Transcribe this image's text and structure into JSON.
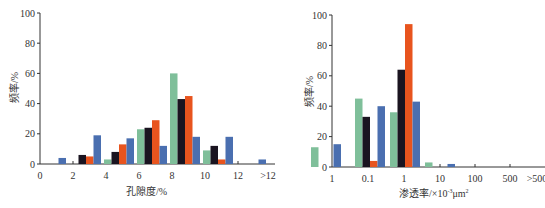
{
  "colors": {
    "green": "#7fbf9a",
    "black": "#1a1420",
    "orange": "#e8541e",
    "blue": "#4a6fb0"
  },
  "chart_data": [
    {
      "type": "bar",
      "title": "",
      "xlabel": "孔隙度/%",
      "ylabel": "频率/%",
      "ylim": [
        0,
        100
      ],
      "yticks": [
        0,
        20,
        40,
        60,
        80,
        100
      ],
      "xtick_labels": [
        "0",
        "2",
        "4",
        "6",
        "8",
        "10",
        "12",
        ">12"
      ],
      "categories": [
        "0-2",
        "2-4",
        "4-6",
        "6-8",
        "8-10",
        "10-12",
        ">12"
      ],
      "series": [
        {
          "name": "green",
          "color": "#7fbf9a",
          "values": [
            0,
            0,
            3,
            23,
            60,
            9,
            0
          ]
        },
        {
          "name": "black",
          "color": "#1a1420",
          "values": [
            0,
            6,
            8,
            24,
            43,
            12,
            0
          ]
        },
        {
          "name": "orange",
          "color": "#e8541e",
          "values": [
            0,
            5,
            13,
            29,
            45,
            3,
            0
          ]
        },
        {
          "name": "blue",
          "color": "#4a6fb0",
          "values": [
            4,
            19,
            17,
            12,
            18,
            18,
            3
          ]
        }
      ],
      "grid": false,
      "legend": "none"
    },
    {
      "type": "bar",
      "title": "",
      "xlabel": "渗透率/×10⁻³μm²",
      "ylabel": "频率/%",
      "ylim": [
        0,
        100
      ],
      "yticks": [
        0,
        20,
        40,
        60,
        80,
        100
      ],
      "xtick_labels": [
        "1",
        "0.1",
        "1",
        "10",
        "100",
        "500",
        ">500"
      ],
      "categories": [
        "<0.1",
        "0.1-1",
        "1-10",
        "10-100",
        "100-500",
        ">500"
      ],
      "series": [
        {
          "name": "green",
          "color": "#7fbf9a",
          "values": [
            13,
            45,
            36,
            3,
            0,
            0
          ]
        },
        {
          "name": "black",
          "color": "#1a1420",
          "values": [
            0,
            33,
            64,
            0,
            0,
            0
          ]
        },
        {
          "name": "orange",
          "color": "#e8541e",
          "values": [
            0,
            4,
            94,
            0,
            0,
            0
          ]
        },
        {
          "name": "blue",
          "color": "#4a6fb0",
          "values": [
            15,
            40,
            43,
            2,
            0,
            0
          ]
        }
      ],
      "grid": false,
      "legend": "none"
    }
  ],
  "labels": {
    "left_xlabel": "孔隙度/%",
    "left_ylabel": "频率/%",
    "right_xlabel_main": "渗透率/×10",
    "right_xlabel_exp": "-3",
    "right_xlabel_unit": "μm",
    "right_xlabel_unit_exp": "2",
    "right_ylabel": "频率/%"
  }
}
